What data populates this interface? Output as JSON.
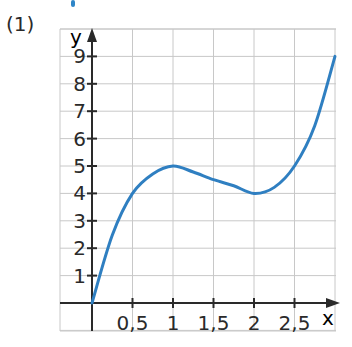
{
  "exercise_label": "(1)",
  "colors": {
    "curve": "#2f7fc1",
    "grid": "#c8c8c8",
    "axis": "#2a2a2a",
    "text": "#2a2a2a"
  },
  "chart_data": {
    "type": "line",
    "title": "",
    "xlabel": "x",
    "ylabel": "y",
    "xlim": [
      -0.4,
      3.0
    ],
    "ylim": [
      -0.35,
      9.3
    ],
    "grid": true,
    "x_ticks": [
      0.5,
      1,
      1.5,
      2,
      2.5
    ],
    "x_tick_labels": [
      "0,5",
      "1",
      "1,5",
      "2",
      "2,5"
    ],
    "y_ticks": [
      1,
      2,
      3,
      4,
      5,
      6,
      7,
      8,
      9
    ],
    "y_tick_labels": [
      "1",
      "2",
      "3",
      "4",
      "5",
      "6",
      "7",
      "8",
      "9"
    ],
    "series": [
      {
        "name": "f(x)",
        "x": [
          0,
          0.25,
          0.5,
          0.75,
          1,
          1.25,
          1.5,
          1.75,
          2,
          2.25,
          2.5,
          2.75,
          3
        ],
        "values": [
          0,
          2.47,
          4,
          4.71,
          5,
          4.78,
          4.5,
          4.28,
          4,
          4.22,
          5,
          6.47,
          9
        ]
      }
    ],
    "annotations": [
      "(1)"
    ]
  }
}
